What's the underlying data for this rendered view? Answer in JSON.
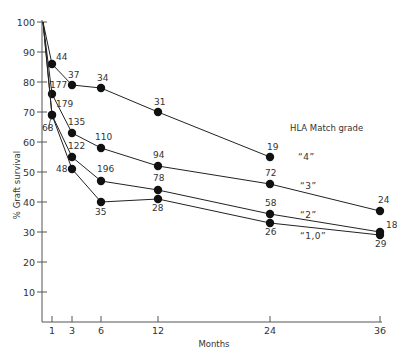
{
  "chart_data": {
    "type": "line",
    "title": "",
    "xlabel": "Months",
    "ylabel": "% Graft survival",
    "xlim": [
      0,
      36
    ],
    "ylim": [
      0,
      100
    ],
    "x_ticks": [
      1,
      3,
      6,
      12,
      24,
      36
    ],
    "y_ticks": [
      10,
      20,
      30,
      40,
      50,
      60,
      70,
      80,
      90,
      100
    ],
    "grid": false,
    "legend": {
      "title": "HLA Match grade",
      "position": "inline-right"
    },
    "series": [
      {
        "name": "\"4\"",
        "x": [
          0,
          1,
          3,
          6,
          12,
          24
        ],
        "values": [
          100,
          86,
          79,
          78,
          70,
          55
        ],
        "point_labels": [
          "",
          "44",
          "37",
          "34",
          "31",
          "19"
        ]
      },
      {
        "name": "\"3\"",
        "x": [
          0,
          1,
          3,
          6,
          12,
          24,
          36
        ],
        "values": [
          100,
          76,
          63,
          58,
          52,
          46,
          37
        ],
        "point_labels": [
          "",
          "177",
          "135",
          "110",
          "94",
          "72",
          "24"
        ]
      },
      {
        "name": "\"2\"",
        "x": [
          0,
          1,
          3,
          6,
          12,
          24,
          36
        ],
        "values": [
          100,
          69,
          55,
          47,
          44,
          36,
          30
        ],
        "point_labels": [
          "",
          "179",
          "122",
          "196",
          "78",
          "58",
          "18"
        ]
      },
      {
        "name": "\"1,0\"",
        "x": [
          0,
          1,
          3,
          6,
          12,
          24,
          36
        ],
        "values": [
          100,
          69,
          51,
          40,
          41,
          33,
          29
        ],
        "point_labels": [
          "",
          "68",
          "48",
          "35",
          "28",
          "26",
          "29"
        ]
      }
    ]
  },
  "labels": {
    "xlabel": "Months",
    "ylabel": "% Graft survival",
    "legend_title": "HLA Match grade",
    "legend_4": "“4”",
    "legend_3": "“3”",
    "legend_2": "“2”",
    "legend_10": "“1,0”"
  }
}
